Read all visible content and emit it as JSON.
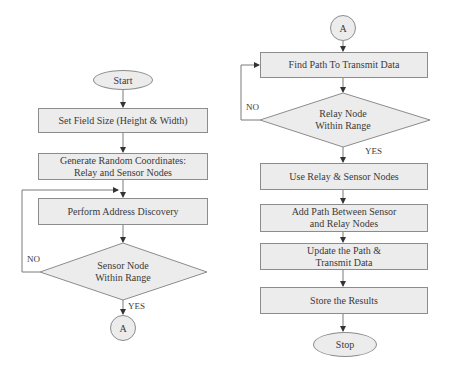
{
  "colors": {
    "shape_fill": "#ececec",
    "shape_border": "#8c8c8c",
    "line": "#7a7a7a",
    "text": "#3a3a3a",
    "background": "#ffffff"
  },
  "left_flow": {
    "start": "Start",
    "step1": "Set Field Size (Height & Width)",
    "step2_line1": "Generate Random Coordinates:",
    "step2_line2": "Relay and Sensor Nodes",
    "step3": "Perform Address Discovery",
    "decision_line1": "Sensor Node",
    "decision_line2": "Within Range",
    "no_label": "NO",
    "yes_label": "YES",
    "connector": "A"
  },
  "right_flow": {
    "connector": "A",
    "step1": "Find Path To Transmit Data",
    "decision_line1": "Relay Node",
    "decision_line2": "Within Range",
    "no_label": "NO",
    "yes_label": "YES",
    "step2": "Use Relay & Sensor Nodes",
    "step3_line1": "Add Path Between Sensor",
    "step3_line2": "and Relay Nodes",
    "step4_line1": "Update the Path &",
    "step4_line2": "Transmit Data",
    "step5": "Store the Results",
    "stop": "Stop"
  }
}
